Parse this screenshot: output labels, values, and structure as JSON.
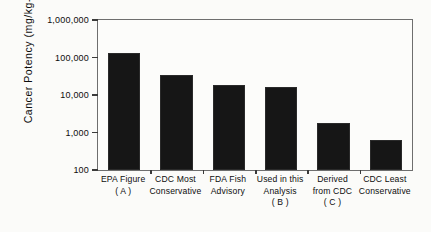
{
  "chart_data": {
    "type": "bar",
    "title": "",
    "xlabel": "",
    "ylabel": "Cancer Potency  (mg/kg-day)",
    "ylabel_superscript": "-1",
    "yscale": "log",
    "ylim": [
      100,
      1000000
    ],
    "grid": false,
    "legend": null,
    "ytick_labels": [
      "1,000,000",
      "100,000",
      "10,000",
      "1,000",
      "100"
    ],
    "ytick_values": [
      1000000,
      100000,
      10000,
      1000,
      100
    ],
    "categories": [
      "EPA Figure (A)",
      "CDC Most Conservative",
      "FDA Fish Advisory",
      "Used in this Analysis (B)",
      "Derived from CDC (C)",
      "CDC Least Conservative"
    ],
    "category_lines": [
      [
        "EPA Figure",
        "( A )",
        ""
      ],
      [
        "CDC Most",
        "Conservative",
        ""
      ],
      [
        "FDA Fish",
        "Advisory",
        ""
      ],
      [
        "Used in this",
        "Analysis",
        "( B )"
      ],
      [
        "Derived",
        "from CDC",
        "( C )"
      ],
      [
        "CDC Least",
        "Conservative",
        ""
      ]
    ],
    "values": [
      130000,
      35000,
      18000,
      16000,
      1800,
      650
    ],
    "bar_color": "#161616"
  }
}
